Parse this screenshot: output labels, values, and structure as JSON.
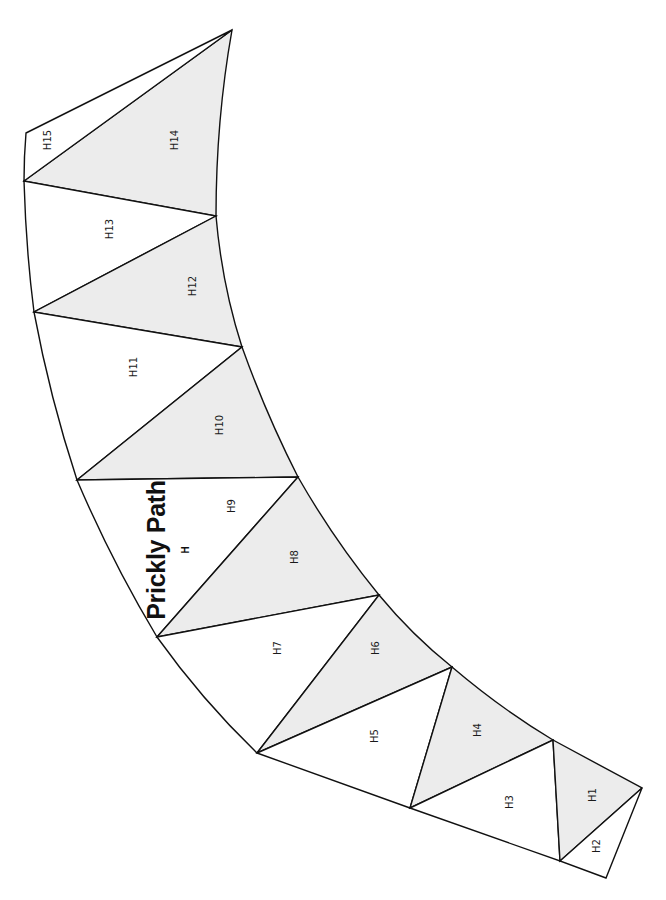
{
  "pattern": {
    "title": "Prickly Path",
    "section_letter": "H",
    "colors": {
      "shaded": "#ececec",
      "plain": "#ffffff",
      "line": "#111111"
    },
    "pieces": [
      {
        "label": "H1",
        "shaded": true
      },
      {
        "label": "H2",
        "shaded": false
      },
      {
        "label": "H3",
        "shaded": false
      },
      {
        "label": "H4",
        "shaded": true
      },
      {
        "label": "H5",
        "shaded": false
      },
      {
        "label": "H6",
        "shaded": true
      },
      {
        "label": "H7",
        "shaded": false
      },
      {
        "label": "H8",
        "shaded": true
      },
      {
        "label": "H9",
        "shaded": false
      },
      {
        "label": "H10",
        "shaded": true
      },
      {
        "label": "H11",
        "shaded": false
      },
      {
        "label": "H12",
        "shaded": true
      },
      {
        "label": "H13",
        "shaded": false
      },
      {
        "label": "H14",
        "shaded": true
      },
      {
        "label": "H15",
        "shaded": false
      }
    ]
  }
}
